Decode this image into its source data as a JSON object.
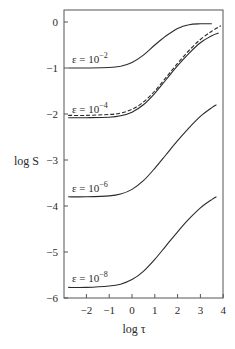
{
  "chart_data": {
    "type": "line",
    "title": "",
    "xlabel": "log τ",
    "ylabel": "log S",
    "xlim": [
      -2.8,
      4.0
    ],
    "ylim": [
      -6,
      0.3
    ],
    "grid": false,
    "legend": "inline labels",
    "x_ticks": [
      "−2",
      "−1",
      "0",
      "1",
      "2",
      "3",
      "4"
    ],
    "x_tick_values": [
      -2,
      -1,
      0,
      1,
      2,
      3,
      4
    ],
    "y_ticks": [
      "0",
      "−1",
      "−2",
      "−3",
      "−4",
      "−5",
      "−6"
    ],
    "y_tick_values": [
      0,
      -1,
      -2,
      -3,
      -4,
      -5,
      -6
    ],
    "series": [
      {
        "name": "ε = 10⁻²",
        "style": "solid",
        "label_base": "ε = 10",
        "label_exp": "−2",
        "x": [
          -2.8,
          -2,
          -1,
          -0.5,
          0,
          0.5,
          1,
          1.5,
          2,
          2.5,
          3,
          3.5
        ],
        "y": [
          -1.0,
          -1.0,
          -0.99,
          -0.96,
          -0.88,
          -0.72,
          -0.5,
          -0.3,
          -0.14,
          -0.06,
          -0.04,
          -0.04
        ]
      },
      {
        "name": "ε = 10⁻⁴",
        "style": "solid",
        "label_base": "ε = 10",
        "label_exp": "−4",
        "x": [
          -2.8,
          -2,
          -1,
          -0.5,
          0,
          0.5,
          1,
          1.5,
          2,
          2.5,
          3,
          3.5,
          3.8
        ],
        "y": [
          -2.08,
          -2.08,
          -2.07,
          -2.04,
          -1.96,
          -1.8,
          -1.55,
          -1.25,
          -0.95,
          -0.68,
          -0.45,
          -0.3,
          -0.24
        ]
      },
      {
        "name": "ε = 10⁻⁴ (dashed)",
        "style": "dashed",
        "x": [
          -2.8,
          -2,
          -1,
          -0.5,
          0,
          0.5,
          1,
          1.5,
          2,
          2.5,
          3,
          3.5,
          3.9
        ],
        "y": [
          -2.03,
          -2.03,
          -2.01,
          -1.98,
          -1.9,
          -1.74,
          -1.5,
          -1.2,
          -0.9,
          -0.62,
          -0.38,
          -0.2,
          -0.08
        ]
      },
      {
        "name": "ε = 10⁻⁶",
        "style": "solid",
        "label_base": "ε = 10",
        "label_exp": "−6",
        "x": [
          -2.8,
          -2,
          -1,
          -0.5,
          0,
          0.5,
          1,
          1.5,
          2,
          2.5,
          3,
          3.5,
          3.7
        ],
        "y": [
          -3.8,
          -3.8,
          -3.78,
          -3.74,
          -3.64,
          -3.45,
          -3.18,
          -2.88,
          -2.58,
          -2.3,
          -2.05,
          -1.86,
          -1.8
        ]
      },
      {
        "name": "ε = 10⁻⁸",
        "style": "solid",
        "label_base": "ε = 10",
        "label_exp": "−8",
        "x": [
          -2.8,
          -2,
          -1,
          -0.5,
          0,
          0.5,
          1,
          1.5,
          2,
          2.5,
          3,
          3.5,
          3.7
        ],
        "y": [
          -5.77,
          -5.77,
          -5.74,
          -5.7,
          -5.6,
          -5.42,
          -5.16,
          -4.86,
          -4.56,
          -4.28,
          -4.04,
          -3.86,
          -3.8
        ]
      }
    ]
  }
}
